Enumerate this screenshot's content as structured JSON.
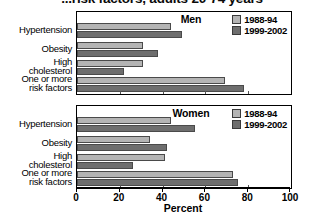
{
  "chart_data": {
    "type": "bar",
    "orientation": "horizontal",
    "title": "...risk factors, adults 20-74 years",
    "xlabel": "Percent",
    "ylabel": "",
    "xlim": [
      0,
      100
    ],
    "xticks": [
      0,
      20,
      40,
      60,
      80,
      100
    ],
    "grid": false,
    "legend_position": "top-right",
    "categories": [
      "Hypertension",
      "Obesity",
      "High\ncholesterol",
      "One or more\nrisk factors"
    ],
    "panels": [
      {
        "label": "Men",
        "series": [
          {
            "name": "1988-94",
            "color": "#b4b4b4",
            "values": [
              44,
              31,
              31,
              69
            ]
          },
          {
            "name": "1999-2002",
            "color": "#6e6e6e",
            "values": [
              49,
              38,
              22,
              78
            ]
          }
        ]
      },
      {
        "label": "Women",
        "series": [
          {
            "name": "1988-94",
            "color": "#b4b4b4",
            "values": [
              44,
              34,
              41,
              73
            ]
          },
          {
            "name": "1999-2002",
            "color": "#6e6e6e",
            "values": [
              55,
              42,
              26,
              75
            ]
          }
        ]
      }
    ]
  },
  "title": {
    "text": "...risk factors, adults 20-74 years"
  },
  "legend": {
    "items": [
      {
        "label": "1988-94",
        "swatch": "light-gray-swatch"
      },
      {
        "label": "1999-2002",
        "swatch": "dark-gray-swatch"
      }
    ]
  },
  "panels": {
    "men": {
      "label": "Men"
    },
    "women": {
      "label": "Women"
    }
  },
  "categories": {
    "hypertension": {
      "line1": "Hypertension",
      "line2": ""
    },
    "obesity": {
      "line1": "Obesity",
      "line2": ""
    },
    "cholesterol": {
      "line1": "High",
      "line2": "cholesterol"
    },
    "risk_factors": {
      "line1": "One or more",
      "line2": "risk factors"
    }
  },
  "axis": {
    "title": "Percent",
    "ticks": [
      {
        "value": 0,
        "label": "0"
      },
      {
        "value": 20,
        "label": "20"
      },
      {
        "value": 40,
        "label": "40"
      },
      {
        "value": 60,
        "label": "60"
      },
      {
        "value": 80,
        "label": "80"
      },
      {
        "value": 100,
        "label": "100"
      }
    ]
  }
}
